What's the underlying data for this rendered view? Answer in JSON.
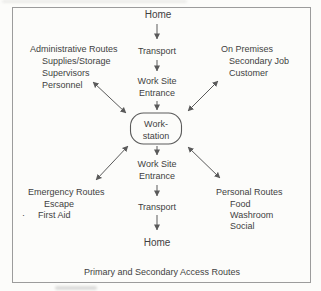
{
  "caption": "Primary and Secondary Access Routes",
  "hub": {
    "line1": "Work-",
    "line2": "station"
  },
  "flow_top": {
    "home": "Home",
    "transport": "Transport",
    "worksite_line1": "Work Site",
    "worksite_line2": "Entrance"
  },
  "flow_bottom": {
    "worksite_line1": "Work Site",
    "worksite_line2": "Entrance",
    "transport": "Transport",
    "home": "Home"
  },
  "corners": {
    "top_left": {
      "title": "Administrative Routes",
      "items": [
        "Supplies/Storage",
        "Supervisors",
        "Personnel"
      ]
    },
    "top_right": {
      "title": "On Premises",
      "items": [
        "Secondary Job",
        "Customer"
      ]
    },
    "bottom_left": {
      "title": "Emergency Routes",
      "bullet": "·",
      "items": [
        "Escape",
        "First Aid"
      ]
    },
    "bottom_right": {
      "title": "Personal Routes",
      "items": [
        "Food",
        "Washroom",
        "Social"
      ]
    }
  },
  "colors": {
    "text": "#3f3f3f",
    "line": "#5a5a5a",
    "frame": "#9c9c9c",
    "background": "#fcfcfa"
  }
}
